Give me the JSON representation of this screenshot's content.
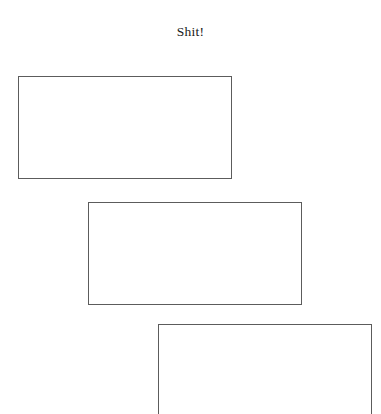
{
  "document": {
    "title": "Shit!",
    "background_color": "#ffffff",
    "width": 381,
    "height": 414
  },
  "title_block": {
    "text": "Shit!",
    "color": "#1a1a1a",
    "align": "center"
  },
  "frames": [
    {
      "name": "frame-1",
      "label": "",
      "x": 18,
      "y": 76,
      "width": 214,
      "height": 103,
      "border_color": "#5c5c5c",
      "border_width": 1,
      "fill": "#ffffff",
      "clipped": false
    },
    {
      "name": "frame-2",
      "label": "",
      "x": 88,
      "y": 202,
      "width": 214,
      "height": 103,
      "border_color": "#5c5c5c",
      "border_width": 1,
      "fill": "#ffffff",
      "clipped": false
    },
    {
      "name": "frame-3",
      "label": "",
      "x": 158,
      "y": 324,
      "width": 214,
      "height": 91,
      "border_color": "#5c5c5c",
      "border_width": 1,
      "fill": "#ffffff",
      "clipped": true
    }
  ]
}
